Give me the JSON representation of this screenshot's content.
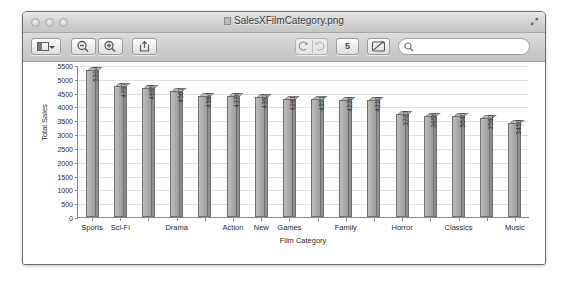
{
  "window": {
    "title": "SalesXFilmCategory.png",
    "traffic_lights": [
      "close",
      "minimize",
      "zoom"
    ]
  },
  "toolbar": {
    "sidebar_label": "",
    "zoom_out_label": "",
    "zoom_in_label": "",
    "share_label": "",
    "rotate_left_label": "",
    "rotate_right_label": "",
    "page_count": "5",
    "markup_label": "",
    "search": {
      "value": "",
      "placeholder": ""
    }
  },
  "chart_data": {
    "type": "bar",
    "title": "",
    "xlabel": "Film Category",
    "ylabel": "Total Sales",
    "ylim": [
      0,
      5500
    ],
    "yticks": [
      5500,
      5000,
      4500,
      4000,
      3500,
      3000,
      2500,
      2000,
      1500,
      1000,
      500,
      0
    ],
    "grid": true,
    "legend": null,
    "categories": [
      "Sports",
      "Sci-Fi",
      "Animation",
      "Drama",
      "Comedy",
      "Action",
      "New",
      "Games",
      "Foreign",
      "Family",
      "Documentary",
      "Horror",
      "Children",
      "Classics",
      "Travel",
      "Music"
    ],
    "tick_labels": [
      "Sports",
      "Sci-Fi",
      "",
      "Drama",
      "",
      "Action",
      "New",
      "Games",
      "",
      "Family",
      "",
      "Horror",
      "",
      "Classics",
      "",
      "Music"
    ],
    "values": [
      5314,
      4757,
      4659,
      4567,
      4384,
      4376,
      4352,
      4281,
      4271,
      4226,
      4218,
      3723,
      3656,
      3640,
      3592,
      3418
    ],
    "bar_color": "#aaaaaa",
    "bar_edge_color": "#6f6f6f"
  }
}
